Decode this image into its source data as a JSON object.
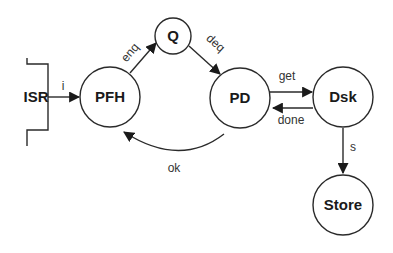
{
  "diagram": {
    "type": "state-flow",
    "colors": {
      "stroke": "#2a2a2a",
      "text": "#1a1a1a",
      "background": "#ffffff"
    },
    "nodes": [
      {
        "id": "isr",
        "label": "ISR",
        "shape": "bracket"
      },
      {
        "id": "pfh",
        "label": "PFH",
        "shape": "circle"
      },
      {
        "id": "q",
        "label": "Q",
        "shape": "circle"
      },
      {
        "id": "pd",
        "label": "PD",
        "shape": "circle"
      },
      {
        "id": "dsk",
        "label": "Dsk",
        "shape": "circle"
      },
      {
        "id": "store",
        "label": "Store",
        "shape": "circle"
      }
    ],
    "edges": [
      {
        "from": "isr",
        "to": "pfh",
        "label": "i"
      },
      {
        "from": "pfh",
        "to": "q",
        "label": "enq"
      },
      {
        "from": "q",
        "to": "pd",
        "label": "deq"
      },
      {
        "from": "pd",
        "to": "dsk",
        "label": "get"
      },
      {
        "from": "dsk",
        "to": "pd",
        "label": "done"
      },
      {
        "from": "pd",
        "to": "pfh",
        "label": "ok"
      },
      {
        "from": "dsk",
        "to": "store",
        "label": "s"
      }
    ]
  }
}
